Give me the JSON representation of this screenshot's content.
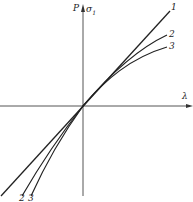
{
  "axes": {
    "y_label_p": "P",
    "y_label_sigma": "σ",
    "y_label_sigma_sub": "1",
    "x_label": "λ"
  },
  "curves": [
    {
      "id": "1",
      "label_top": "1",
      "label_bottom": ""
    },
    {
      "id": "2",
      "label_top": "2",
      "label_bottom": "2"
    },
    {
      "id": "3",
      "label_top": "3",
      "label_bottom": "3"
    }
  ],
  "colors": {
    "ink": "#222222",
    "axis": "#555555"
  }
}
